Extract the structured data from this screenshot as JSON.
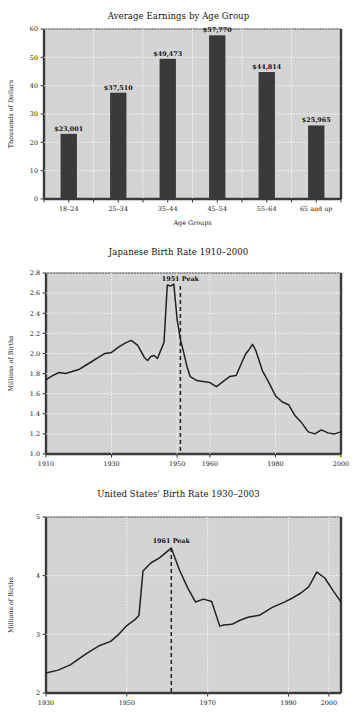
{
  "page": {
    "background": "#ffffff",
    "plot_background": "#d4d4d4",
    "ink": "#333333",
    "gridline_color": "#ffffff"
  },
  "chart_data": [
    {
      "id": "average-earnings-by-age-group",
      "type": "bar",
      "title": "Average Earnings by Age Group",
      "xlabel": "Age Groups",
      "ylabel": "Thousands of Dollars",
      "categories": [
        "18–24",
        "25–34",
        "35–44",
        "45–54",
        "55–64",
        "65 and up"
      ],
      "values": [
        23.001,
        37.51,
        49.473,
        57.77,
        44.814,
        25.965
      ],
      "data_labels": [
        "$23,001",
        "$37,510",
        "$49,473",
        "$57,770",
        "$44,814",
        "$25,965"
      ],
      "ylim": [
        0,
        60
      ],
      "yticks": [
        0,
        10,
        20,
        30,
        40,
        50,
        60
      ],
      "ytick_labels": [
        "0",
        "10",
        "20",
        "30",
        "40",
        "50",
        "60"
      ],
      "grid": true,
      "legend": "none",
      "bar_color": "#3a3a3a"
    },
    {
      "id": "japanese-birth-rate",
      "type": "line",
      "title": "Japanese Birth Rate 1910–2000",
      "xlabel": "",
      "ylabel": "Millions of Births",
      "ylim": [
        1.0,
        2.8
      ],
      "yticks": [
        1.0,
        1.2,
        1.4,
        1.6,
        1.8,
        2.0,
        2.2,
        2.4,
        2.6,
        2.8
      ],
      "ytick_labels": [
        "1.0",
        "1.2",
        "1.4",
        "1.6",
        "1.8",
        "2.0",
        "2.2",
        "2.4",
        "2.6",
        "2.8"
      ],
      "xlim": [
        1910,
        2000
      ],
      "xticks": [
        1910,
        1930,
        1950,
        1960,
        1980,
        2000
      ],
      "xtick_labels": [
        "1910",
        "1930",
        "1950",
        "1960",
        "1980",
        "2000"
      ],
      "grid": true,
      "legend": "none",
      "line_color": "#222222",
      "annotation": {
        "label": "1951 Peak",
        "x": 1951,
        "y": 2.67,
        "style": "dashed-vertical"
      },
      "x": [
        1910,
        1912,
        1914,
        1916,
        1918,
        1920,
        1922,
        1924,
        1926,
        1928,
        1930,
        1932,
        1934,
        1936,
        1938,
        1940,
        1941,
        1942,
        1943,
        1944,
        1946,
        1947,
        1948,
        1949,
        1950,
        1951,
        1952,
        1953,
        1954,
        1956,
        1958,
        1960,
        1962,
        1964,
        1966,
        1968,
        1970,
        1971,
        1972,
        1973,
        1974,
        1976,
        1978,
        1980,
        1982,
        1984,
        1986,
        1988,
        1990,
        1992,
        1994,
        1996,
        1998,
        2000
      ],
      "y": [
        1.74,
        1.78,
        1.81,
        1.8,
        1.82,
        1.84,
        1.88,
        1.92,
        1.96,
        2.0,
        2.01,
        2.06,
        2.1,
        2.13,
        2.08,
        1.96,
        1.93,
        1.97,
        1.98,
        1.95,
        2.11,
        2.68,
        2.67,
        2.69,
        2.34,
        2.14,
        2.01,
        1.87,
        1.77,
        1.73,
        1.72,
        1.71,
        1.67,
        1.72,
        1.77,
        1.78,
        1.93,
        2.0,
        2.04,
        2.09,
        2.03,
        1.83,
        1.71,
        1.58,
        1.52,
        1.49,
        1.38,
        1.31,
        1.22,
        1.2,
        1.24,
        1.21,
        1.2,
        1.22
      ]
    },
    {
      "id": "united-states-birth-rate",
      "type": "line",
      "title": "United States' Birth Rate 1930–2003",
      "xlabel": "",
      "ylabel": "Millions of Births",
      "ylim": [
        2,
        5
      ],
      "yticks": [
        2,
        3,
        4,
        5
      ],
      "ytick_labels": [
        "2",
        "3",
        "4",
        "5"
      ],
      "xlim": [
        1930,
        2003
      ],
      "xticks": [
        1930,
        1950,
        1970,
        1990,
        2000
      ],
      "xtick_labels": [
        "1930",
        "1950",
        "1970",
        "1990",
        "2000"
      ],
      "grid": true,
      "legend": "none",
      "line_color": "#222222",
      "annotation": {
        "label": "1961 Peak",
        "x": 1961,
        "y": 4.47,
        "style": "dashed-vertical"
      },
      "x": [
        1930,
        1933,
        1936,
        1940,
        1943,
        1946,
        1948,
        1950,
        1952,
        1953,
        1954,
        1956,
        1958,
        1961,
        1963,
        1965,
        1967,
        1969,
        1971,
        1973,
        1974,
        1976,
        1978,
        1980,
        1983,
        1986,
        1989,
        1991,
        1993,
        1995,
        1997,
        1999,
        2001,
        2003
      ],
      "y": [
        2.34,
        2.39,
        2.48,
        2.67,
        2.8,
        2.88,
        3.0,
        3.15,
        3.25,
        3.32,
        4.08,
        4.22,
        4.3,
        4.47,
        4.1,
        3.8,
        3.55,
        3.6,
        3.56,
        3.14,
        3.16,
        3.17,
        3.24,
        3.29,
        3.33,
        3.46,
        3.55,
        3.62,
        3.7,
        3.81,
        4.06,
        3.96,
        3.75,
        3.55
      ]
    }
  ]
}
